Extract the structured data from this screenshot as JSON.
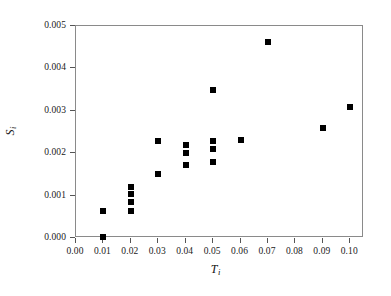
{
  "chart_data": {
    "type": "scatter",
    "title": "",
    "xlabel": "T_i",
    "ylabel": "S_i",
    "xlabel_symbol": "T",
    "xlabel_subscript": "i",
    "ylabel_symbol": "S",
    "ylabel_subscript": "i",
    "xlim": [
      0.0,
      0.105
    ],
    "ylim": [
      0.0,
      0.005
    ],
    "grid": false,
    "legend": null,
    "marker": "square",
    "marker_color": "#000000",
    "x_ticks": [
      0.0,
      0.01,
      0.02,
      0.03,
      0.04,
      0.05,
      0.06,
      0.07,
      0.08,
      0.09,
      0.1
    ],
    "x_tick_labels": [
      "0.00",
      "0.01",
      "0.02",
      "0.03",
      "0.04",
      "0.05",
      "0.06",
      "0.07",
      "0.08",
      "0.09",
      "0.10"
    ],
    "y_ticks": [
      0.0,
      0.001,
      0.002,
      0.003,
      0.004,
      0.005
    ],
    "y_tick_labels": [
      "0.000",
      "0.001",
      "0.002",
      "0.003",
      "0.004",
      "0.005"
    ],
    "points": [
      {
        "x": 0.01,
        "y": 0.00063
      },
      {
        "x": 0.01,
        "y": 3e-05
      },
      {
        "x": 0.02,
        "y": 0.0012
      },
      {
        "x": 0.02,
        "y": 0.00104
      },
      {
        "x": 0.02,
        "y": 0.00085
      },
      {
        "x": 0.02,
        "y": 0.00064
      },
      {
        "x": 0.03,
        "y": 0.00228
      },
      {
        "x": 0.03,
        "y": 0.0015
      },
      {
        "x": 0.04,
        "y": 0.00219
      },
      {
        "x": 0.04,
        "y": 0.00201
      },
      {
        "x": 0.04,
        "y": 0.00172
      },
      {
        "x": 0.05,
        "y": 0.00348
      },
      {
        "x": 0.05,
        "y": 0.00228
      },
      {
        "x": 0.05,
        "y": 0.0021
      },
      {
        "x": 0.05,
        "y": 0.0018
      },
      {
        "x": 0.06,
        "y": 0.00232
      },
      {
        "x": 0.07,
        "y": 0.00463
      },
      {
        "x": 0.09,
        "y": 0.00259
      },
      {
        "x": 0.1,
        "y": 0.0031
      }
    ]
  },
  "figure": {
    "background_color": "#ffffff",
    "frame_color": "#8a8a8a",
    "tick_color": "#555555",
    "text_color": "#1a1a1a"
  }
}
